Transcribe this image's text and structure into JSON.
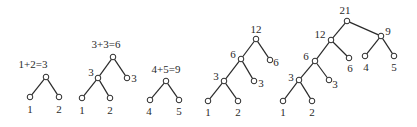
{
  "diagram": {
    "trees": [
      {
        "id": "tree-1",
        "title": "1+2=3",
        "title_pos": [
          33,
          68
        ],
        "nodes": [
          {
            "id": "r",
            "x": 46,
            "y": 77,
            "label": ""
          },
          {
            "id": "a",
            "x": 30,
            "y": 97,
            "label": "1",
            "lx": 30,
            "ly": 113
          },
          {
            "id": "b",
            "x": 59,
            "y": 97,
            "label": "2",
            "lx": 59,
            "ly": 113
          }
        ],
        "edges": [
          [
            "r",
            "a"
          ],
          [
            "r",
            "b"
          ]
        ]
      },
      {
        "id": "tree-2",
        "title": "3+3=6",
        "title_pos": [
          106,
          48
        ],
        "nodes": [
          {
            "id": "r",
            "x": 113,
            "y": 57,
            "label": ""
          },
          {
            "id": "n3",
            "x": 98,
            "y": 78,
            "label": "3",
            "lx": 91,
            "ly": 76
          },
          {
            "id": "l3",
            "x": 127,
            "y": 78,
            "label": "3",
            "lx": 134,
            "ly": 82
          },
          {
            "id": "a",
            "x": 82,
            "y": 98,
            "label": "1",
            "lx": 82,
            "ly": 114
          },
          {
            "id": "b",
            "x": 110,
            "y": 98,
            "label": "2",
            "lx": 110,
            "ly": 114
          }
        ],
        "edges": [
          [
            "r",
            "n3"
          ],
          [
            "r",
            "l3"
          ],
          [
            "n3",
            "a"
          ],
          [
            "n3",
            "b"
          ]
        ]
      },
      {
        "id": "tree-3",
        "title": "4+5=9",
        "title_pos": [
          166,
          73
        ],
        "nodes": [
          {
            "id": "r",
            "x": 166,
            "y": 81,
            "label": ""
          },
          {
            "id": "a",
            "x": 150,
            "y": 100,
            "label": "4",
            "lx": 149,
            "ly": 115
          },
          {
            "id": "b",
            "x": 179,
            "y": 100,
            "label": "5",
            "lx": 179,
            "ly": 115
          }
        ],
        "edges": [
          [
            "r",
            "a"
          ],
          [
            "r",
            "b"
          ]
        ]
      },
      {
        "id": "tree-4",
        "title": "",
        "nodes": [
          {
            "id": "r",
            "x": 256,
            "y": 39,
            "label": "12",
            "lx": 256,
            "ly": 33
          },
          {
            "id": "n6",
            "x": 241,
            "y": 59,
            "label": "6",
            "lx": 233,
            "ly": 58
          },
          {
            "id": "l6",
            "x": 270,
            "y": 60,
            "label": "6",
            "lx": 276,
            "ly": 66
          },
          {
            "id": "n3",
            "x": 224,
            "y": 81,
            "label": "3",
            "lx": 216,
            "ly": 80
          },
          {
            "id": "l3",
            "x": 254,
            "y": 81,
            "label": "3",
            "lx": 261,
            "ly": 87
          },
          {
            "id": "a",
            "x": 208,
            "y": 101,
            "label": "1",
            "lx": 208,
            "ly": 116
          },
          {
            "id": "b",
            "x": 238,
            "y": 101,
            "label": "2",
            "lx": 238,
            "ly": 116
          }
        ],
        "edges": [
          [
            "r",
            "n6"
          ],
          [
            "r",
            "l6"
          ],
          [
            "n6",
            "n3"
          ],
          [
            "n6",
            "l3"
          ],
          [
            "n3",
            "a"
          ],
          [
            "n3",
            "b"
          ]
        ]
      },
      {
        "id": "tree-5",
        "title": "",
        "nodes": [
          {
            "id": "r",
            "x": 347,
            "y": 21,
            "label": "21",
            "lx": 345,
            "ly": 14
          },
          {
            "id": "n12",
            "x": 331,
            "y": 40,
            "label": "12",
            "lx": 320,
            "ly": 38
          },
          {
            "id": "n9",
            "x": 381,
            "y": 36,
            "label": "9",
            "lx": 388,
            "ly": 35
          },
          {
            "id": "n6",
            "x": 315,
            "y": 61,
            "label": "6",
            "lx": 306,
            "ly": 60
          },
          {
            "id": "l6",
            "x": 349,
            "y": 58,
            "label": "6",
            "lx": 350,
            "ly": 72
          },
          {
            "id": "l4",
            "x": 365,
            "y": 56,
            "label": "4",
            "lx": 366,
            "ly": 71
          },
          {
            "id": "l5",
            "x": 394,
            "y": 56,
            "label": "5",
            "lx": 394,
            "ly": 71
          },
          {
            "id": "n3",
            "x": 299,
            "y": 80,
            "label": "3",
            "lx": 291,
            "ly": 81
          },
          {
            "id": "l3",
            "x": 329,
            "y": 80,
            "label": "3",
            "lx": 335,
            "ly": 88
          },
          {
            "id": "a",
            "x": 283,
            "y": 101,
            "label": "1",
            "lx": 283,
            "ly": 116
          },
          {
            "id": "b",
            "x": 312,
            "y": 101,
            "label": "2",
            "lx": 312,
            "ly": 116
          }
        ],
        "edges": [
          [
            "r",
            "n12"
          ],
          [
            "r",
            "n9"
          ],
          [
            "n12",
            "n6"
          ],
          [
            "n12",
            "l6"
          ],
          [
            "n9",
            "l4"
          ],
          [
            "n9",
            "l5"
          ],
          [
            "n6",
            "n3"
          ],
          [
            "n6",
            "l3"
          ],
          [
            "n3",
            "a"
          ],
          [
            "n3",
            "b"
          ]
        ]
      }
    ]
  }
}
